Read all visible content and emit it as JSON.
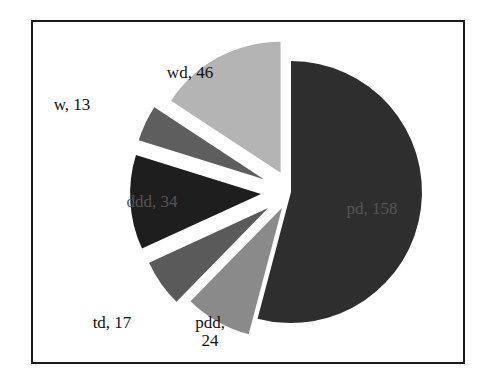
{
  "chart_data": {
    "type": "pie",
    "title": "",
    "exploded": true,
    "start_angle_deg": 0,
    "direction": "clockwise",
    "slices": [
      {
        "label": "pd",
        "value": 158,
        "display": "pd, 158",
        "color": "#2e2e2e",
        "explode": 0
      },
      {
        "label": "pdd",
        "value": 24,
        "display": "pdd, 24",
        "color": "#8a8a8a",
        "explode": 18
      },
      {
        "label": "td",
        "value": 17,
        "display": "td, 17",
        "color": "#5a5a5a",
        "explode": 28
      },
      {
        "label": "ddd",
        "value": 34,
        "display": "ddd, 34",
        "color": "#1e1e1e",
        "explode": 30
      },
      {
        "label": "w",
        "value": 13,
        "display": "w, 13",
        "color": "#5e5e5e",
        "explode": 30
      },
      {
        "label": "wd",
        "value": 46,
        "display": "wd, 46",
        "color": "#b4b4b4",
        "explode": 22
      }
    ],
    "legend": null
  }
}
